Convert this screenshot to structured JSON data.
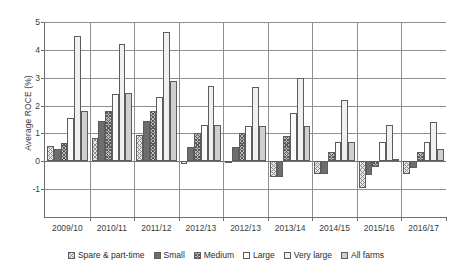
{
  "chart_data": {
    "type": "bar",
    "title": "",
    "xlabel": "",
    "ylabel": "Average ROCE (%)",
    "ylim": [
      -2,
      5
    ],
    "yticks": [
      5,
      4,
      3,
      2,
      1,
      0,
      -1
    ],
    "ytick_labels": [
      "5",
      "4",
      "3",
      "2",
      "1",
      "0",
      "-1"
    ],
    "grid": true,
    "legend_position": "bottom",
    "categories": [
      "2009/10",
      "2010/11",
      "2011/12",
      "2012/13",
      "2012/13",
      "2013/14",
      "2014/15",
      "2015/16",
      "2016/17"
    ],
    "series": [
      {
        "name": "Spare & part-time",
        "pattern": "light-cross-hatch",
        "color": "#e8e8e8",
        "values": [
          0.55,
          0.85,
          0.95,
          -0.1,
          -0.05,
          -0.55,
          -0.45,
          -0.95,
          -0.45
        ]
      },
      {
        "name": "Small",
        "pattern": "dark-grey-solid",
        "color": "#6e6e6e",
        "values": [
          0.45,
          1.45,
          1.45,
          0.5,
          0.5,
          -0.55,
          -0.45,
          -0.5,
          -0.25
        ]
      },
      {
        "name": "Medium",
        "pattern": "dense-cross-hatch",
        "color": "#bdbdbd",
        "values": [
          0.65,
          1.8,
          1.8,
          1.0,
          1.0,
          0.9,
          0.35,
          -0.2,
          0.35
        ]
      },
      {
        "name": "Large",
        "pattern": "white",
        "color": "#fbfbfb",
        "values": [
          1.55,
          2.4,
          2.3,
          1.3,
          1.25,
          1.75,
          0.7,
          0.7,
          0.7
        ]
      },
      {
        "name": "Very large",
        "pattern": "light-dotted",
        "color": "#f0f0f0",
        "values": [
          4.5,
          4.2,
          4.65,
          2.7,
          2.65,
          3.0,
          2.2,
          1.3,
          1.4
        ]
      },
      {
        "name": "All farms",
        "pattern": "flat-light-grey",
        "color": "#cfcfcf",
        "values": [
          1.8,
          2.45,
          2.9,
          1.3,
          1.25,
          1.25,
          0.7,
          0.1,
          0.45
        ]
      }
    ]
  },
  "axis": {
    "y_title": "Average ROCE (%)"
  }
}
